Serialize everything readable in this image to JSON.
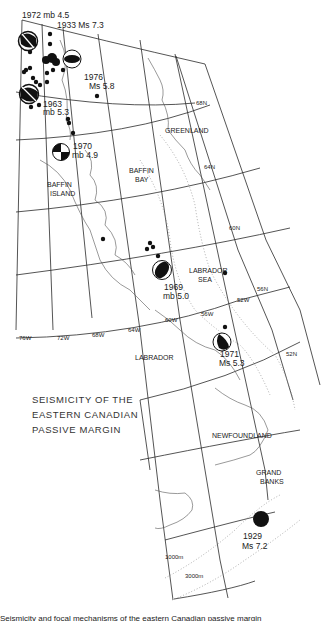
{
  "figure": {
    "title_lines": [
      "SEISMICITY  OF THE",
      "EASTERN  CANADIAN",
      "PASSIVE   MARGIN"
    ],
    "caption_cropped": "Seismicity and focal mechanisms of the eastern Canadian passive margin"
  },
  "regions": {
    "greenland": "GREENLAND",
    "baffin_island_1": "BAFFIN",
    "baffin_island_2": "ISLAND",
    "baffin_bay_1": "BAFFIN",
    "baffin_bay_2": "BAY",
    "labrador_sea_1": "LABRADOR",
    "labrador_sea_2": "SEA",
    "labrador": "LABRADOR",
    "newfoundland": "NEWFOUNDLAND",
    "grand_banks_1": "GRAND",
    "grand_banks_2": "BANKS"
  },
  "graticule": {
    "latitudes": [
      "68N",
      "64N",
      "60N",
      "56N",
      "52N"
    ],
    "longitudes": [
      "76W",
      "72W",
      "68W",
      "64W",
      "60W",
      "56W",
      "52W"
    ]
  },
  "bathymetry": {
    "contour_1": "1000m",
    "contour_2": "3000m"
  },
  "events": [
    {
      "year": "1972",
      "mag": "mb 4.5",
      "label": "1972  mb 4.5"
    },
    {
      "year": "1933",
      "mag": "Ms 7.3",
      "label": "1933 Ms 7.3"
    },
    {
      "year": "1976",
      "mag": "Ms 5.8",
      "line1": "1976",
      "line2": "Ms 5.8"
    },
    {
      "year": "1963",
      "mag": "mb 5.3",
      "line1": "1963",
      "line2": "mb 5.3"
    },
    {
      "year": "1970",
      "mag": "mb 4.9",
      "line1": "1970",
      "line2": "mb 4.9"
    },
    {
      "year": "1969",
      "mag": "mb 5.0",
      "line1": "1969",
      "line2": "mb 5.0"
    },
    {
      "year": "1971",
      "mag": "Ms 5.3",
      "line1": "1971",
      "line2": "Ms 5.3"
    },
    {
      "year": "1929",
      "mag": "Ms 7.2",
      "line1": "1929",
      "line2": "Ms 7.2"
    }
  ],
  "colors": {
    "ink": "#1a1a1a",
    "grid": "#2a2a2a",
    "coast": "#555555",
    "contour": "#888888",
    "background": "#ffffff"
  }
}
